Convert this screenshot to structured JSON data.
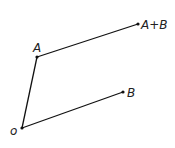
{
  "diagram": {
    "points": {
      "O": {
        "label": "o",
        "x": 22,
        "y": 128
      },
      "A": {
        "label": "A",
        "x": 37,
        "y": 57
      },
      "B": {
        "label": "B",
        "x": 123,
        "y": 92
      },
      "AB": {
        "label": "A+B",
        "x": 138,
        "y": 24
      }
    },
    "edges": [
      {
        "from": "O",
        "to": "A"
      },
      {
        "from": "A",
        "to": "AB"
      },
      {
        "from": "O",
        "to": "B"
      }
    ],
    "line_color": "#111111"
  }
}
